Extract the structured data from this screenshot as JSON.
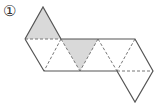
{
  "label": "①",
  "diagram": {
    "type": "triangle-net",
    "colors": {
      "stroke": "#555555",
      "shade": "#d9d9d9",
      "dashed": "#777777"
    }
  }
}
